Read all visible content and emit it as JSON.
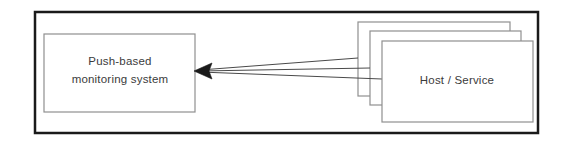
{
  "diagram": {
    "type": "block-diagram",
    "background_color": "#ffffff",
    "frame": {
      "name": "outer-frame",
      "x": 35,
      "y": 12,
      "width": 503,
      "height": 121,
      "stroke": "#1a1a1a",
      "stroke_width": 2.5,
      "fill": "#ffffff"
    },
    "nodes": [
      {
        "id": "push-based-monitoring-system",
        "label_lines": [
          "Push-based",
          "monitoring system"
        ],
        "line1": "Push-based",
        "line2": "monitoring system",
        "shape": "rectangle",
        "x": 44,
        "y": 34,
        "width": 151,
        "height": 78,
        "stroke": "#8a8a8a",
        "stroke_width": 1.2,
        "fill": "#ffffff"
      },
      {
        "id": "host-service-back",
        "label": "",
        "shape": "rectangle",
        "x": 358,
        "y": 22,
        "width": 152,
        "height": 74,
        "stroke": "#8a8a8a",
        "stroke_width": 1.2,
        "fill": "#ffffff"
      },
      {
        "id": "host-service-middle",
        "label": "",
        "shape": "rectangle",
        "x": 370,
        "y": 31,
        "width": 151,
        "height": 74,
        "stroke": "#8a8a8a",
        "stroke_width": 1.2,
        "fill": "#ffffff"
      },
      {
        "id": "host-service-front",
        "label": "Host / Service",
        "shape": "rectangle",
        "x": 382,
        "y": 41,
        "width": 151,
        "height": 81,
        "stroke": "#8a8a8a",
        "stroke_width": 1.2,
        "fill": "#ffffff"
      }
    ],
    "connectors": [
      {
        "id": "push-arrow-back",
        "from": "host-service-back",
        "to": "push-based-monitoring-system",
        "from_point": [
          358,
          58
        ],
        "to_point": [
          196,
          71
        ],
        "direction": "right-to-left",
        "arrowhead": "filled-triangle",
        "stroke": "#4a4a4a",
        "stroke_width": 1
      },
      {
        "id": "push-arrow-middle",
        "from": "host-service-middle",
        "to": "push-based-monitoring-system",
        "from_point": [
          370,
          68
        ],
        "to_point": [
          196,
          71
        ],
        "direction": "right-to-left",
        "arrowhead": "filled-triangle",
        "stroke": "#4a4a4a",
        "stroke_width": 1
      },
      {
        "id": "push-arrow-front",
        "from": "host-service-front",
        "to": "push-based-monitoring-system",
        "from_point": [
          382,
          79
        ],
        "to_point": [
          196,
          71
        ],
        "direction": "right-to-left",
        "arrowhead": "filled-triangle",
        "stroke": "#4a4a4a",
        "stroke_width": 1
      }
    ],
    "arrowhead": {
      "name": "arrowhead-left",
      "tip_x": 194,
      "tip_y": 71,
      "color": "#1a1a1a"
    }
  }
}
